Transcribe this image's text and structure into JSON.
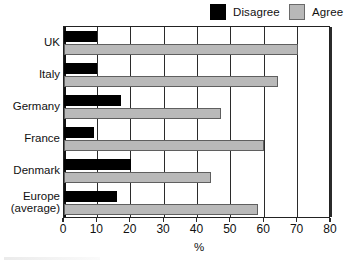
{
  "chart_data": {
    "type": "bar",
    "orientation": "horizontal",
    "title": "",
    "xlabel": "%",
    "ylabel": "",
    "xlim": [
      0,
      80
    ],
    "xticks": [
      0,
      10,
      20,
      30,
      40,
      50,
      60,
      70,
      80
    ],
    "xtick_labels": [
      "0",
      "10",
      "20",
      "30",
      "40",
      "50",
      "60",
      "70",
      "80"
    ],
    "grid": true,
    "grid_axis": "x",
    "legend_position": "top-right",
    "categories": [
      "UK",
      "Italy",
      "Germany",
      "France",
      "Denmark",
      "Europe (average)"
    ],
    "category_labels": [
      {
        "line1": "UK",
        "line2": ""
      },
      {
        "line1": "Italy",
        "line2": ""
      },
      {
        "line1": "Germany",
        "line2": ""
      },
      {
        "line1": "France",
        "line2": ""
      },
      {
        "line1": "Denmark",
        "line2": ""
      },
      {
        "line1": "Europe",
        "line2": "(average)"
      }
    ],
    "series": [
      {
        "name": "Disagree",
        "color": "#000000",
        "values": [
          10,
          10,
          17,
          9,
          20,
          16
        ]
      },
      {
        "name": "Agree",
        "color": "#b9b9b9",
        "values": [
          70,
          64,
          47,
          60,
          44,
          58
        ]
      }
    ]
  },
  "legend": {
    "items": [
      {
        "label": "Disagree",
        "swatch": "black-square-swatch"
      },
      {
        "label": "Agree",
        "swatch": "gray-square-swatch"
      }
    ]
  },
  "axis": {
    "x_title": "%"
  }
}
